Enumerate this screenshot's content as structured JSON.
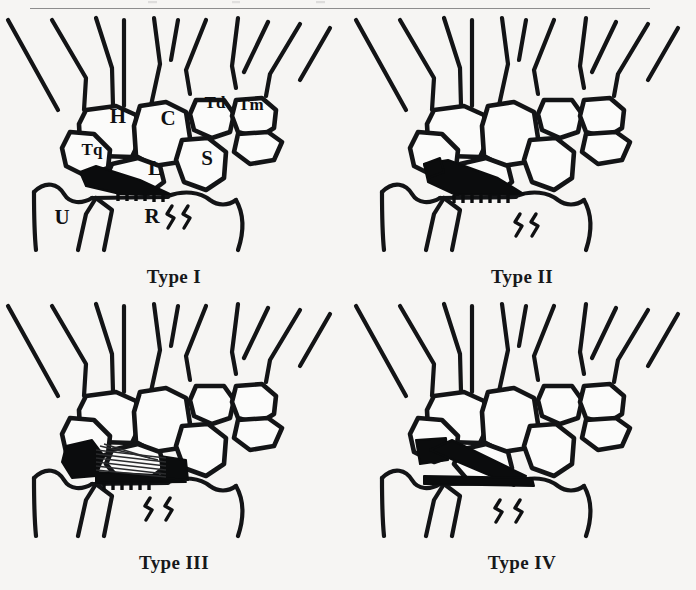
{
  "figure": {
    "background_color": "#f6f5f3",
    "ink_color": "#131416",
    "rule_color": "#8d8d8d",
    "panel_count": 4
  },
  "panels": [
    {
      "id": "type-1",
      "caption": "Type I",
      "labels_shown": true,
      "bone_labels": [
        {
          "key": "hamate",
          "text": "H",
          "x": 118,
          "y": 104
        },
        {
          "key": "capitate",
          "text": "C",
          "x": 168,
          "y": 106
        },
        {
          "key": "trapezoid",
          "text": "Td",
          "x": 215,
          "y": 90
        },
        {
          "key": "trapezium",
          "text": "Tm",
          "x": 251,
          "y": 92
        },
        {
          "key": "triquetrum",
          "text": "Tq",
          "x": 92,
          "y": 137
        },
        {
          "key": "lunate",
          "text": "L",
          "x": 155,
          "y": 156
        },
        {
          "key": "scaphoid",
          "text": "S",
          "x": 207,
          "y": 146
        },
        {
          "key": "ulna",
          "text": "U",
          "x": 62,
          "y": 205
        },
        {
          "key": "radius",
          "text": "R",
          "x": 152,
          "y": 204
        }
      ],
      "lesion": {
        "style": "solid-wedge-serrated",
        "description": "narrow solid black lens with serrated distal edge"
      }
    },
    {
      "id": "type-2",
      "caption": "Type II",
      "labels_shown": false,
      "bone_labels": [],
      "lesion": {
        "style": "solid-wedge-wide-serrated",
        "description": "wider solid black wedge with serrated edge"
      }
    },
    {
      "id": "type-3",
      "caption": "Type III",
      "labels_shown": false,
      "bone_labels": [],
      "lesion": {
        "style": "fan-hatched",
        "description": "solid black base with radiating fan hatch lines"
      }
    },
    {
      "id": "type-4",
      "caption": "Type IV",
      "labels_shown": false,
      "bone_labels": [],
      "lesion": {
        "style": "solid-diagonal-band",
        "description": "solid black oblique band crossing the joint line"
      }
    }
  ]
}
